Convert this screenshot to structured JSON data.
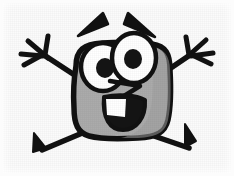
{
  "image": {
    "title": "Happy Cartoon Character",
    "subject": "square-bodied smiling cartoon figure with raised arms",
    "width": 234,
    "height": 176,
    "alt_text": "Cartoon drawing of a grey rounded-square character with two large eyes, angled eyebrows, a zigzag nose, a wide open smile, star-shaped hands raised up and two pointed feet",
    "background_color": "#fbfbfb",
    "texture": "light paper grain / halftone scan noise"
  },
  "palette": {
    "ink": "#111111",
    "body_fill": "#ababab",
    "body_shadow": "#9a9a9a",
    "eye_white": "#ffffff",
    "pupil": "#141414",
    "mouth_inside": "#141414",
    "tooth": "#ffffff",
    "paper": "#fbfbfb"
  },
  "parts": {
    "body": {
      "label": "Body",
      "shape": "rounded square (squircle)",
      "fill": "#ababab",
      "outline": "#111111",
      "outline_width": 5
    },
    "left_eyebrow": {
      "label": "Left eyebrow",
      "shape": "tapered wedge",
      "angle_deg": -28,
      "fill": "#111111"
    },
    "right_eyebrow": {
      "label": "Right eyebrow",
      "shape": "tapered wedge",
      "angle_deg": 28,
      "fill": "#111111"
    },
    "left_eye": {
      "label": "Left eye",
      "shape": "oval",
      "fill": "#ffffff",
      "pupil_fill": "#141414"
    },
    "right_eye": {
      "label": "Right eye",
      "shape": "oval",
      "fill": "#ffffff",
      "pupil_fill": "#141414"
    },
    "nose": {
      "label": "Nose",
      "shape": "zigzag angular line",
      "stroke": "#111111"
    },
    "mouth": {
      "label": "Mouth",
      "shape": "wide open smile",
      "fill": "#141414",
      "tooth_fill": "#ffffff"
    },
    "left_arm": {
      "label": "Left arm",
      "shape": "diagonal stroke raised up-left",
      "stroke": "#111111"
    },
    "right_arm": {
      "label": "Right arm",
      "shape": "diagonal stroke raised up-right",
      "stroke": "#111111"
    },
    "left_hand": {
      "label": "Left hand",
      "shape": "star / asterisk burst",
      "stroke": "#111111"
    },
    "right_hand": {
      "label": "Right hand",
      "shape": "star / asterisk burst",
      "stroke": "#111111"
    },
    "left_leg": {
      "label": "Left leg",
      "shape": "diagonal stroke with pointed foot",
      "stroke": "#111111"
    },
    "right_leg": {
      "label": "Right leg",
      "shape": "diagonal stroke with pointed foot",
      "stroke": "#111111"
    },
    "left_foot": {
      "label": "Left foot",
      "shape": "pointed wedge",
      "fill": "#111111"
    },
    "right_foot": {
      "label": "Right foot",
      "shape": "pointed wedge",
      "fill": "#111111"
    }
  }
}
